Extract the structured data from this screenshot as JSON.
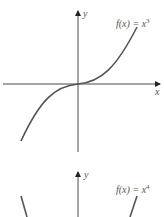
{
  "graphs": [
    {
      "function_label": "f(x) = x",
      "exponent": "3",
      "x_axis_label": "x",
      "y_axis_label": "y"
    },
    {
      "function_label": "f(x) = x",
      "exponent": "4",
      "y_axis_label": "y"
    }
  ],
  "colors": {
    "axis": "#4a4a4a",
    "curve": "#555555",
    "text": "#555555"
  }
}
